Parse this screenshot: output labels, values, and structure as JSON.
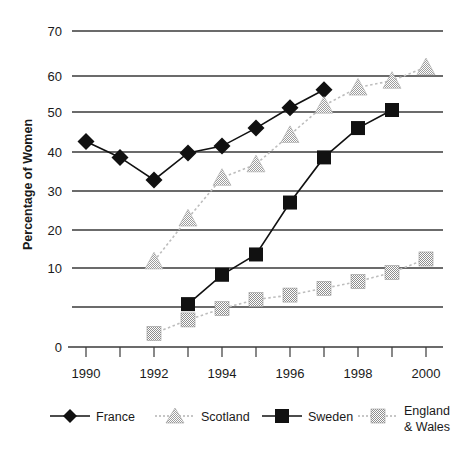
{
  "chart_data": {
    "type": "line",
    "title": "",
    "xlabel": "",
    "ylabel": "Percentage of Women",
    "x": [
      1990,
      1991,
      1992,
      1993,
      1994,
      1995,
      1996,
      1997,
      1998,
      1999,
      2000
    ],
    "xlim": [
      1989.5,
      2000.5
    ],
    "ylim": [
      0,
      70
    ],
    "yticks": [
      0,
      10,
      20,
      30,
      40,
      50,
      60,
      70
    ],
    "xticks": [
      1990,
      1991,
      1992,
      1993,
      1994,
      1995,
      1996,
      1997,
      1998,
      1999,
      2000
    ],
    "xtick_labels_shown": [
      "1990",
      "1992",
      "1994",
      "1996",
      "1998",
      "2000"
    ],
    "grid": "horizontal",
    "legend_position": "bottom",
    "series": [
      {
        "name": "France",
        "marker": "diamond",
        "color": "#111111",
        "line_style": "solid",
        "x": [
          1990,
          1991,
          1992,
          1993,
          1994,
          1995,
          1996,
          1997
        ],
        "values": [
          45.5,
          42.0,
          37.0,
          43.0,
          44.5,
          48.5,
          53.0,
          57.0
        ]
      },
      {
        "name": "Scotland",
        "marker": "triangle",
        "color": "#a8a8a8",
        "line_style": "dotted",
        "x": [
          1992,
          1993,
          1994,
          1995,
          1996,
          1997,
          1998,
          1999,
          2000
        ],
        "values": [
          19.0,
          28.5,
          37.5,
          40.5,
          47.0,
          53.5,
          57.5,
          59.0,
          62.0
        ]
      },
      {
        "name": "Sweden",
        "marker": "square",
        "color": "#111111",
        "line_style": "solid",
        "x": [
          1993,
          1994,
          1995,
          1996,
          1997,
          1998,
          1999
        ],
        "values": [
          9.5,
          16.0,
          20.5,
          32.0,
          42.0,
          48.5,
          52.5
        ]
      },
      {
        "name": "England & Wales",
        "marker": "square",
        "color": "#9a9a9a",
        "line_style": "dotted",
        "x": [
          1992,
          1993,
          1994,
          1995,
          1996,
          1997,
          1998,
          1999,
          2000
        ],
        "values": [
          3.0,
          6.0,
          8.5,
          10.5,
          11.5,
          13.0,
          14.5,
          16.5,
          19.5
        ]
      }
    ]
  },
  "axis": {
    "y_title": "Percentage of Women",
    "y_tick_0": "0",
    "y_tick_10": "10",
    "y_tick_20": "20",
    "y_tick_30": "30",
    "y_tick_40": "40",
    "y_tick_50": "50",
    "y_tick_60": "60",
    "y_tick_70": "70",
    "x_tick_1990": "1990",
    "x_tick_1992": "1992",
    "x_tick_1994": "1994",
    "x_tick_1996": "1996",
    "x_tick_1998": "1998",
    "x_tick_2000": "2000"
  },
  "legend": {
    "items": [
      {
        "label": "France",
        "marker": "diamond-icon",
        "color": "#111111"
      },
      {
        "label": "Scotland",
        "marker": "triangle-icon",
        "color": "#a8a8a8"
      },
      {
        "label": "Sweden",
        "marker": "square-icon",
        "color": "#111111"
      },
      {
        "label": "England",
        "label2": "& Wales",
        "marker": "square-icon",
        "color": "#9a9a9a"
      }
    ]
  }
}
